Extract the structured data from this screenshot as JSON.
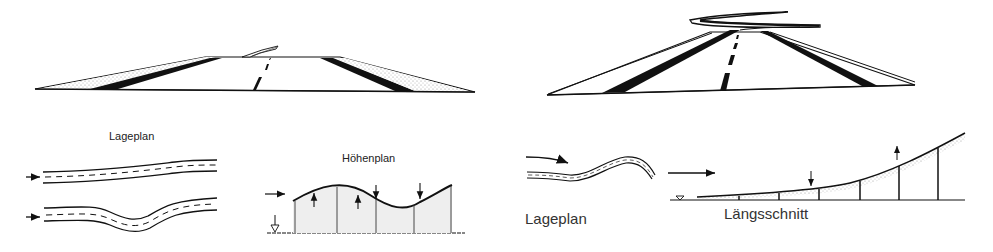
{
  "diagram": {
    "panels": [
      {
        "id": "left-perspective",
        "description": "Perspective view of road cresting a hill; continuation disappears with small leftward bend visible beyond crest"
      },
      {
        "id": "right-perspective",
        "description": "Perspective view of road rising over crest with sharp S-curve visible beyond"
      }
    ],
    "labels": {
      "lageplan_left": "Lageplan",
      "hoehenplan": "Höhenplan",
      "lageplan_right": "Lageplan",
      "laengsschnitt": "Längsschnitt"
    },
    "colors": {
      "ink": "#111111",
      "shade": "#bdbdbd",
      "background": "#ffffff"
    }
  }
}
